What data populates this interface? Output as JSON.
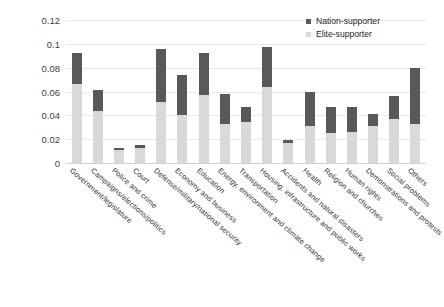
{
  "chart_data": {
    "type": "bar",
    "subtype": "stacked-vertical",
    "title": "",
    "subtitle": "",
    "xlabel": "",
    "ylabel": "",
    "ylim": [
      0,
      0.12
    ],
    "ytick_labels": [
      "0",
      "0.02",
      "0.04",
      "0.06",
      "0.08",
      "0.1",
      "0.12"
    ],
    "ytick_values": [
      0,
      0.02,
      0.04,
      0.06,
      0.08,
      0.1,
      0.12
    ],
    "grid": true,
    "grid_axis": "y",
    "legend_position": "top-right",
    "categories": [
      "Government/legislature",
      "Campaigns/elections/politics",
      "Police and crime",
      "Court",
      "Defense/military/national security",
      "Economy and business",
      "Education",
      "Energy, environment and climate change",
      "Transportation",
      "Housing, infrastructure and public works",
      "Accidents and natural disasters",
      "Health",
      "Religion and churches",
      "Human rights",
      "Demonstrations and protests",
      "Social problems",
      "Others"
    ],
    "series": [
      {
        "name": "Elite-supporter",
        "color": "#d9d9d9",
        "stack_order": 0,
        "values": [
          0.066,
          0.044,
          0.011,
          0.013,
          0.051,
          0.04,
          0.057,
          0.033,
          0.034,
          0.064,
          0.017,
          0.031,
          0.025,
          0.026,
          0.031,
          0.037,
          0.033
        ]
      },
      {
        "name": "Nation-supporter",
        "color": "#595959",
        "stack_order": 1,
        "values": [
          0.026,
          0.017,
          0.002,
          0.002,
          0.045,
          0.034,
          0.035,
          0.025,
          0.013,
          0.033,
          0.002,
          0.029,
          0.022,
          0.021,
          0.01,
          0.019,
          0.047
        ]
      }
    ],
    "totals": [
      0.0925,
      0.061,
      0.013,
      0.015,
      0.096,
      0.074,
      0.092,
      0.058,
      0.047,
      0.097,
      0.019,
      0.06,
      0.047,
      0.047,
      0.041,
      0.056,
      0.08
    ],
    "annotations": []
  },
  "legend": {
    "entries": [
      {
        "label": "Nation-supporter",
        "color": "#595959"
      },
      {
        "label": "Elite-supporter",
        "color": "#d9d9d9"
      }
    ]
  },
  "colors": {
    "nation_supporter": "#595959",
    "elite_supporter": "#d9d9d9",
    "gridline": "#e8e8e8",
    "axis_text": "#404040",
    "background": "#ffffff"
  }
}
